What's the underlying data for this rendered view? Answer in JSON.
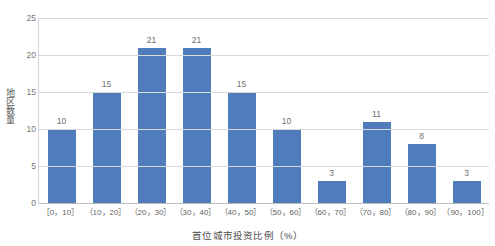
{
  "chart_data": {
    "type": "bar",
    "title": "",
    "xlabel": "首位城市投资比例（%）",
    "ylabel": "地区数量",
    "categories": [
      "［0，10］",
      "（10，20］",
      "（20，30］",
      "（30，40］",
      "（40，50］",
      "（50，60］",
      "（60，70］",
      "（70，80］",
      "（80，90］",
      "（90，100］"
    ],
    "values": [
      10,
      15,
      21,
      21,
      15,
      10,
      3,
      11,
      8,
      3
    ],
    "ylim": [
      0,
      25
    ],
    "yticks": [
      0,
      5,
      10,
      15,
      20,
      25
    ],
    "ytick_labels": [
      "0",
      "5",
      "10",
      "15",
      "20",
      "25"
    ],
    "grid": true,
    "legend": false,
    "bar_color": "#4f7cba",
    "data_labels": [
      "10",
      "15",
      "21",
      "21",
      "15",
      "10",
      "3",
      "11",
      "8",
      "3"
    ]
  }
}
